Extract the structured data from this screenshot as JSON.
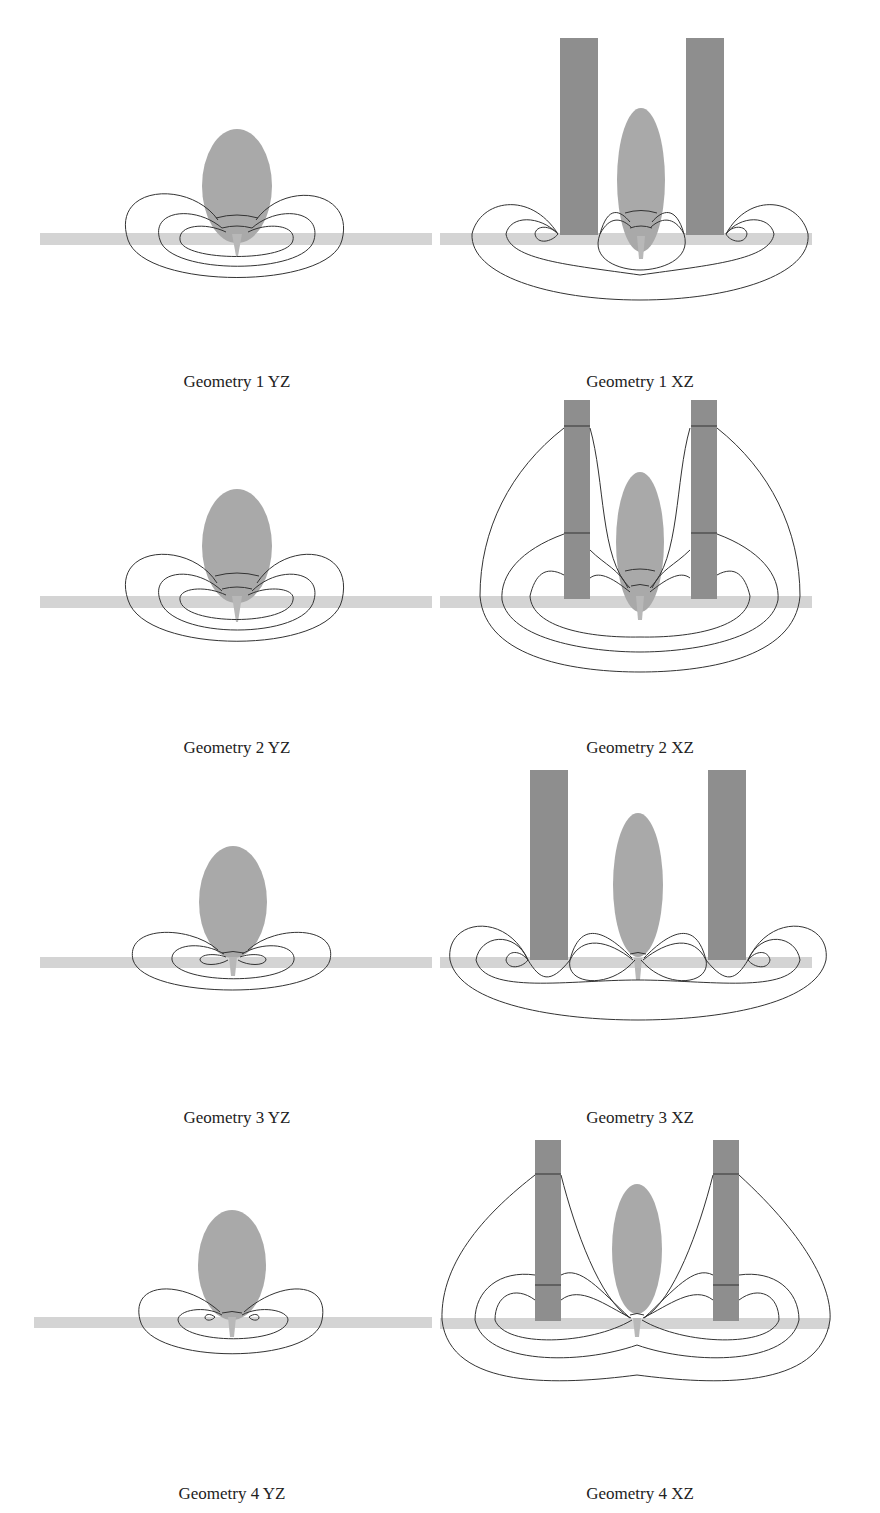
{
  "figure": {
    "colors": {
      "ellipse": "#a9a9a9",
      "electrode": "#8e8e8e",
      "ground_band": "#d4d4d4",
      "field_line": "#333333",
      "background": "#ffffff"
    },
    "panels": [
      {
        "id": "g1-yz",
        "caption": "Geometry 1 YZ",
        "view": "YZ",
        "geometry": 1
      },
      {
        "id": "g1-xz",
        "caption": "Geometry 1 XZ",
        "view": "XZ",
        "geometry": 1
      },
      {
        "id": "g2-yz",
        "caption": "Geometry 2 YZ",
        "view": "YZ",
        "geometry": 2
      },
      {
        "id": "g2-xz",
        "caption": "Geometry 2 XZ",
        "view": "XZ",
        "geometry": 2
      },
      {
        "id": "g3-yz",
        "caption": "Geometry 3 YZ",
        "view": "YZ",
        "geometry": 3
      },
      {
        "id": "g3-xz",
        "caption": "Geometry 3 XZ",
        "view": "XZ",
        "geometry": 3
      },
      {
        "id": "g4-yz",
        "caption": "Geometry 4 YZ",
        "view": "YZ",
        "geometry": 4
      },
      {
        "id": "g4-xz",
        "caption": "Geometry 4 XZ",
        "view": "XZ",
        "geometry": 4
      }
    ]
  }
}
